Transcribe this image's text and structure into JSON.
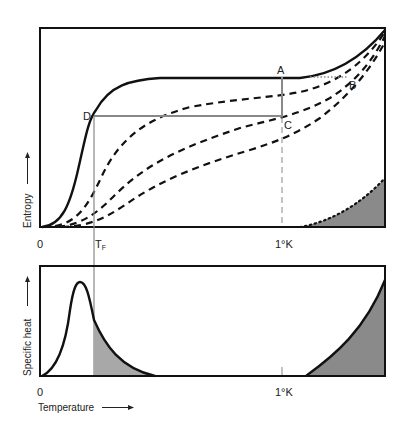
{
  "top_panel": {
    "name": "entropy-vs-temperature",
    "ylabel": "Entropy",
    "x_ticks": [
      {
        "label": "0",
        "x": 0
      },
      {
        "label": "T",
        "sub": "F",
        "x": 94
      },
      {
        "label": "1°K",
        "x": 282
      }
    ],
    "point_labels": {
      "A": "A",
      "B": "B",
      "C": "C",
      "D": "D"
    },
    "curves": [
      {
        "name": "zero-field-entropy",
        "style": "solid"
      },
      {
        "name": "field-1-entropy",
        "style": "dashed"
      },
      {
        "name": "field-2-entropy",
        "style": "dashed"
      },
      {
        "name": "field-3-entropy",
        "style": "dashed"
      },
      {
        "name": "lattice-entropy",
        "style": "dotted",
        "fill": "#8a8a8a"
      }
    ]
  },
  "bottom_panel": {
    "name": "specific-heat-vs-temperature",
    "ylabel": "Specific heat",
    "xlabel": "Temperature",
    "x_ticks": [
      {
        "label": "0"
      },
      {
        "label": "1°K"
      }
    ],
    "curves": [
      {
        "name": "magnetic-specific-heat-peak",
        "style": "solid",
        "shaded_region": "T > T_F",
        "fill": "#a8a8a8"
      },
      {
        "name": "lattice-specific-heat",
        "style": "solid",
        "fill": "#8a8a8a"
      }
    ]
  },
  "colors": {
    "line": "#111111",
    "guide": "#888888",
    "fill_light": "#a8a8a8",
    "fill_dark": "#8a8a8a"
  }
}
